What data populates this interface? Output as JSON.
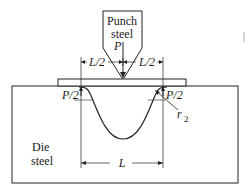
{
  "diagram": {
    "punch": {
      "label_line1": "Punch",
      "label_line2": "steel",
      "force": "P"
    },
    "half_span_left": "L/2",
    "half_span_right": "L/2",
    "reaction_left": "P/2",
    "reaction_right": "P/2",
    "radius": "r",
    "radius_subscript": "2",
    "die": {
      "label_line1": "Die",
      "label_line2": "steel"
    },
    "span": "L",
    "colors": {
      "stroke": "#222222",
      "background": "#ffffff"
    }
  }
}
